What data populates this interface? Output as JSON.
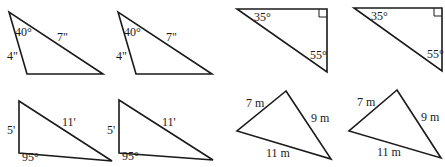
{
  "figures": [
    {
      "id": "triangle-a-1",
      "points": "9,12 27,74 103,74",
      "labels": [
        {
          "text": "40°",
          "x": 15,
          "y": 36
        },
        {
          "text": "7\"",
          "x": 57,
          "y": 41
        },
        {
          "text": "4\"",
          "x": 7,
          "y": 60
        }
      ]
    },
    {
      "id": "triangle-a-2",
      "points": "118,12 136,74 212,74",
      "labels": [
        {
          "text": "40°",
          "x": 124,
          "y": 36
        },
        {
          "text": "7\"",
          "x": 166,
          "y": 41
        },
        {
          "text": "4\"",
          "x": 116,
          "y": 60
        }
      ]
    },
    {
      "id": "triangle-b-1",
      "points": "237,9 327,9 327,72",
      "right_angle": "319,9 319,17 327,17",
      "labels": [
        {
          "text": "35°",
          "x": 254,
          "y": 21
        },
        {
          "text": "55°",
          "x": 310,
          "y": 59
        }
      ]
    },
    {
      "id": "triangle-b-2",
      "points": "354,8 442,8 442,71",
      "right_angle": "434,8 434,16 442,16",
      "labels": [
        {
          "text": "35°",
          "x": 371,
          "y": 20
        },
        {
          "text": "55°",
          "x": 427,
          "y": 58
        }
      ]
    },
    {
      "id": "triangle-c-1",
      "points": "19,101 19,153 112,161",
      "labels": [
        {
          "text": "5'",
          "x": 7,
          "y": 134
        },
        {
          "text": "11'",
          "x": 62,
          "y": 126
        },
        {
          "text": "95°",
          "x": 22,
          "y": 161
        }
      ]
    },
    {
      "id": "triangle-c-2",
      "points": "119,100 119,153 213,160",
      "labels": [
        {
          "text": "5'",
          "x": 107,
          "y": 134
        },
        {
          "text": "11'",
          "x": 162,
          "y": 126
        },
        {
          "text": "95°",
          "x": 122,
          "y": 160
        }
      ]
    },
    {
      "id": "triangle-d-1",
      "points": "286,91 237,131 331,159",
      "labels": [
        {
          "text": "7 m",
          "x": 246,
          "y": 107
        },
        {
          "text": "9 m",
          "x": 311,
          "y": 122
        },
        {
          "text": "11 m",
          "x": 266,
          "y": 157
        }
      ]
    },
    {
      "id": "triangle-d-2",
      "points": "397,90 349,131 441,158",
      "labels": [
        {
          "text": "7 m",
          "x": 357,
          "y": 106
        },
        {
          "text": "9 m",
          "x": 421,
          "y": 121
        },
        {
          "text": "11 m",
          "x": 377,
          "y": 156
        }
      ]
    }
  ]
}
